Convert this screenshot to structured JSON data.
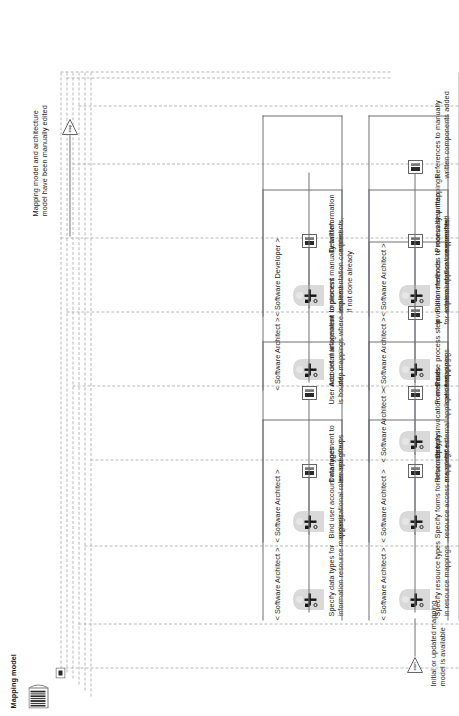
{
  "diagram": {
    "title": "Mapping model",
    "type": "bpmn-process",
    "orientation": "rotated-90"
  },
  "start_event": {
    "badge": "start",
    "label": "Initial or updated mapping\nmodel is available"
  },
  "end_event": {
    "badge": "stop",
    "label": "Mapping model and architecture\nmodel have been manually edited"
  },
  "data_object": {
    "label": "Mapping model",
    "icon": "document-barcode-icon"
  },
  "lanes": [
    {
      "id": "lane-1",
      "role": "< Software Architect >",
      "task": "Specify resource types\nin resource mappings",
      "result": "Resource types\nare specified",
      "icon": "actor-icon",
      "result_icon": "result-doc-icon"
    },
    {
      "id": "lane-2",
      "role": "< Software Architect >",
      "task": "Specify data types for\ninformation resource mappings",
      "result": "Data types\nare specified",
      "icon": "actor-icon",
      "result_icon": "result-doc-icon"
    },
    {
      "id": "lane-3",
      "role": "< Software Architect >",
      "task": "Specify forms for information\nresource access mappings",
      "result": "Forms are\nspecified",
      "icon": "actor-icon",
      "result_icon": "result-doc-icon"
    },
    {
      "id": "lane-4",
      "role": "< Software Architect >",
      "task": "Bind user account management to\norganizational roles and groups",
      "result": "User account management\nis bound",
      "icon": "actor-icon",
      "result_icon": "result-doc-icon"
    },
    {
      "id": "lane-5",
      "role": "< Software Architect >",
      "task": "Specify invocation methods\nfor external application mappings",
      "result": "Invocation methods\nfor external application specified",
      "icon": "actor-icon",
      "result_icon": "result-doc-icon"
    },
    {
      "id": "lane-6",
      "role": "< Software Architect >",
      "task": "Revise process step\nmappings",
      "result": "Process step mappings\nare revised",
      "icon": "actor-icon",
      "result_icon": "result-doc-icon"
    },
    {
      "id": "lane-7",
      "role": "< Software Architect >",
      "task": "Add detail information to process\nstep mappings where required",
      "result": "Detail information\nadded",
      "icon": "actor-icon",
      "result_icon": "result-doc-icon"
    },
    {
      "id": "lane-8",
      "role": "< Software Architect >",
      "task": "Fill-in references to manually written\nimplementation components",
      "result": "References to manually\nwritten components added",
      "icon": "actor-icon",
      "result_icon": "result-doc-icon"
    },
    {
      "id": "lane-9",
      "role": "< Software Developer >",
      "task": "Implement manually written\nimplementation components,\nif not done already",
      "result": "",
      "icon": "actor-icon",
      "result_icon": ""
    }
  ],
  "colors": {
    "connector": "#6e6e78",
    "routing_dash": "#b8b8b8",
    "text": "#1b1b1b",
    "actor_fill": "#d9d9d9"
  }
}
